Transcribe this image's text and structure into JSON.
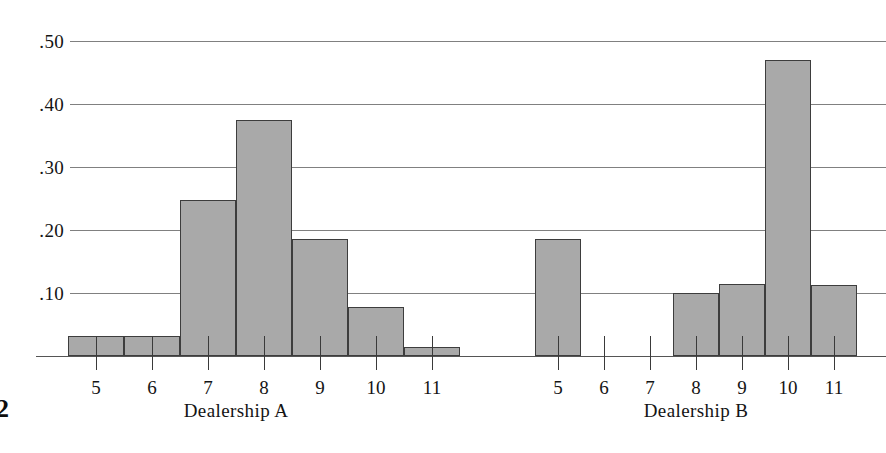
{
  "page": {
    "page_number": "2"
  },
  "chart_data": {
    "type": "bar",
    "title": "",
    "subtitle": "",
    "xlabel": "",
    "ylabel": "",
    "ylim": [
      0,
      0.53
    ],
    "grid": true,
    "legend_position": "none",
    "y_ticks": [
      ".50",
      ".40",
      ".30",
      ".20",
      ".10"
    ],
    "y_tick_values": [
      0.5,
      0.4,
      0.3,
      0.2,
      0.1
    ],
    "panels": [
      {
        "name": "Dealership A",
        "label": "Dealership A",
        "categories": [
          "5",
          "6",
          "7",
          "8",
          "9",
          "10",
          "11"
        ],
        "values": [
          0.032,
          0.032,
          0.248,
          0.375,
          0.185,
          0.077,
          0.014
        ]
      },
      {
        "name": "Dealership B",
        "label": "Dealership B",
        "categories": [
          "5",
          "6",
          "7",
          "8",
          "9",
          "10",
          "11"
        ],
        "values": [
          0.185,
          0.0,
          0.0,
          0.1,
          0.115,
          0.47,
          0.113
        ]
      }
    ],
    "colors": {
      "bar_fill": "#a9a9a9",
      "bar_stroke": "#3d3d3d",
      "gridline": "#808080",
      "axis": "#555555",
      "text": "#141414"
    }
  }
}
